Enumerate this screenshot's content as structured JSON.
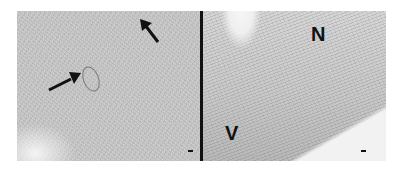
{
  "figure": {
    "panels": [
      {
        "id": "left",
        "description": "grayscale histology micrograph with two black arrows",
        "arrows": [
          {
            "direction": "up-left",
            "position": "top-right"
          },
          {
            "direction": "right",
            "position": "center-left"
          }
        ],
        "scale_bar": "-"
      },
      {
        "id": "right",
        "description": "grayscale histology micrograph with labels N and V",
        "labels": [
          "N",
          "V"
        ],
        "scale_bar": "-"
      }
    ],
    "label_n": "N",
    "label_v": "V",
    "colors": {
      "tissue": "#cdcdcd",
      "divider": "#111111",
      "label": "#111111"
    }
  }
}
